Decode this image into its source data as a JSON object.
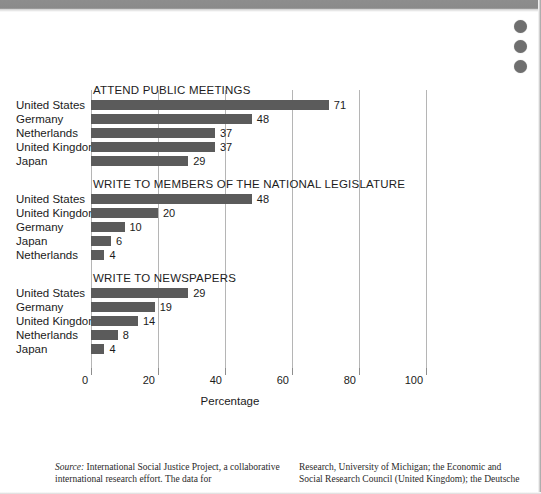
{
  "page": {
    "background": "#ffffff",
    "band_color": "#8d8d8d",
    "bar_color": "#5b5b5b",
    "grid_color": "#b5b5b5"
  },
  "marks": {
    "dot_1": "binder-dot",
    "dot_2": "binder-dot",
    "dot_3": "binder-dot"
  },
  "chart_data": {
    "type": "bar",
    "orientation": "horizontal",
    "title": "",
    "xlabel": "Percentage",
    "ylabel": "",
    "xlim": [
      0,
      100
    ],
    "xticks": [
      0,
      20,
      40,
      60,
      80,
      100
    ],
    "xticklabels": [
      "0",
      "20",
      "40",
      "60",
      "80",
      "100"
    ],
    "grid": "vertical",
    "legend": "none",
    "panels": [
      {
        "title": "ATTEND PUBLIC MEETINGS",
        "categories": [
          "United States",
          "Germany",
          "Netherlands",
          "United Kingdom",
          "Japan"
        ],
        "values": [
          71,
          48,
          37,
          37,
          29
        ],
        "labels": [
          "71",
          "48",
          "37",
          "37",
          "29"
        ]
      },
      {
        "title": "WRITE TO MEMBERS OF THE NATIONAL LEGISLATURE",
        "categories": [
          "United States",
          "United Kingdom",
          "Germany",
          "Japan",
          "Netherlands"
        ],
        "values": [
          48,
          20,
          10,
          6,
          4
        ],
        "labels": [
          "48",
          "20",
          "10",
          "6",
          "4"
        ]
      },
      {
        "title": "WRITE TO NEWSPAPERS",
        "categories": [
          "United States",
          "Germany",
          "United Kingdom",
          "Netherlands",
          "Japan"
        ],
        "values": [
          29,
          19,
          14,
          8,
          4
        ],
        "labels": [
          "29",
          "19",
          "14",
          "8",
          "4"
        ]
      }
    ]
  },
  "footer": {
    "source_prefix": "Source:",
    "col1": " International Social Justice Project, a collaborative international research effort. The data for",
    "col2": "Research, University of Michigan; the Economic and Social Research Council (United Kingdom); the Deutsche"
  }
}
